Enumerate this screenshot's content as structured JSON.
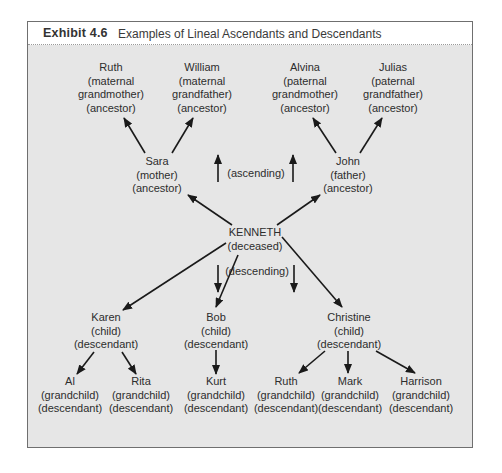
{
  "exhibit": {
    "label": "Exhibit 4.6",
    "title": "Examples of Lineal Ascendants and Descendants"
  },
  "colors": {
    "panel_background": "#e6e6e6",
    "title_background": "#ffffff",
    "border": "#6f6f6f",
    "text": "#2d2d2d",
    "arrow": "#1a1a1a"
  },
  "nodes": {
    "ruth_gm": {
      "name": "Ruth",
      "relation": "(maternal",
      "relation2": "grandmother)",
      "role": "(ancestor)"
    },
    "william": {
      "name": "William",
      "relation": "(maternal",
      "relation2": "grandfather)",
      "role": "(ancestor)"
    },
    "alvina": {
      "name": "Alvina",
      "relation": "(paternal",
      "relation2": "grandmother)",
      "role": "(ancestor)"
    },
    "julias": {
      "name": "Julias",
      "relation": "(paternal",
      "relation2": "grandfather)",
      "role": "(ancestor)"
    },
    "sara": {
      "name": "Sara",
      "relation": "(mother)",
      "role": "(ancestor)"
    },
    "john": {
      "name": "John",
      "relation": "(father)",
      "role": "(ancestor)"
    },
    "kenneth": {
      "name": "KENNETH",
      "status": "(deceased)"
    },
    "karen": {
      "name": "Karen",
      "relation": "(child)",
      "role": "(descendant)"
    },
    "bob": {
      "name": "Bob",
      "relation": "(child)",
      "role": "(descendant)"
    },
    "christine": {
      "name": "Christine",
      "relation": "(child)",
      "role": "(descendant)"
    },
    "al": {
      "name": "Al",
      "relation": "(grandchild)",
      "role": "(descendant)"
    },
    "rita": {
      "name": "Rita",
      "relation": "(grandchild)",
      "role": "(descendant)"
    },
    "kurt": {
      "name": "Kurt",
      "relation": "(grandchild)",
      "role": "(descendant)"
    },
    "ruth_gc": {
      "name": "Ruth",
      "relation": "(grandchild)",
      "role": "(descendant)"
    },
    "mark": {
      "name": "Mark",
      "relation": "(grandchild)",
      "role": "(descendant)"
    },
    "harrison": {
      "name": "Harrison",
      "relation": "(grandchild)",
      "role": "(descendant)"
    }
  },
  "directions": {
    "ascending": "(ascending)",
    "descending": "(descending)"
  },
  "edges": [
    {
      "from": "kenneth",
      "to": "sara"
    },
    {
      "from": "kenneth",
      "to": "john"
    },
    {
      "from": "sara",
      "to": "ruth_gm"
    },
    {
      "from": "sara",
      "to": "william"
    },
    {
      "from": "john",
      "to": "alvina"
    },
    {
      "from": "john",
      "to": "julias"
    },
    {
      "from": "kenneth",
      "to": "karen"
    },
    {
      "from": "kenneth",
      "to": "bob"
    },
    {
      "from": "kenneth",
      "to": "christine"
    },
    {
      "from": "karen",
      "to": "al"
    },
    {
      "from": "karen",
      "to": "rita"
    },
    {
      "from": "bob",
      "to": "kurt"
    },
    {
      "from": "christine",
      "to": "ruth_gc"
    },
    {
      "from": "christine",
      "to": "mark"
    },
    {
      "from": "christine",
      "to": "harrison"
    }
  ]
}
